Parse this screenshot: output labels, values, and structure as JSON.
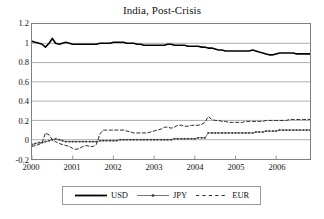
{
  "chart_data": {
    "type": "line",
    "title": "India, Post-Crisis",
    "xlabel": "",
    "ylabel": "",
    "ylim": [
      -0.2,
      1.2
    ],
    "xlim": [
      2000.0,
      2006.83
    ],
    "ytick_labels": [
      "1.2",
      "1",
      "0.8",
      "0.6",
      "0.4",
      "0.2",
      "0",
      "-0.2"
    ],
    "ytick_values": [
      1.2,
      1.0,
      0.8,
      0.6,
      0.4,
      0.2,
      0.0,
      -0.2
    ],
    "xtick_labels": [
      "2000",
      "2001",
      "2002",
      "2003",
      "2004",
      "2005",
      "2006"
    ],
    "xtick_values": [
      2000,
      2001,
      2002,
      2003,
      2004,
      2005,
      2006
    ],
    "grid": "horizontal",
    "legend_position": "below",
    "series": [
      {
        "name": "USD",
        "style": "solid-thick",
        "color": "#000000",
        "x": [
          2000.0,
          2000.08,
          2000.17,
          2000.25,
          2000.33,
          2000.42,
          2000.5,
          2000.58,
          2000.67,
          2000.75,
          2000.83,
          2000.92,
          2001.0,
          2001.08,
          2001.17,
          2001.25,
          2001.33,
          2001.42,
          2001.5,
          2001.58,
          2001.67,
          2001.75,
          2001.83,
          2001.92,
          2002.0,
          2002.08,
          2002.17,
          2002.25,
          2002.33,
          2002.42,
          2002.5,
          2002.58,
          2002.67,
          2002.75,
          2002.83,
          2002.92,
          2003.0,
          2003.08,
          2003.17,
          2003.25,
          2003.33,
          2003.42,
          2003.5,
          2003.58,
          2003.67,
          2003.75,
          2003.83,
          2003.92,
          2004.0,
          2004.08,
          2004.17,
          2004.25,
          2004.33,
          2004.42,
          2004.5,
          2004.58,
          2004.67,
          2004.75,
          2004.83,
          2004.92,
          2005.0,
          2005.08,
          2005.17,
          2005.25,
          2005.33,
          2005.42,
          2005.5,
          2005.58,
          2005.67,
          2005.75,
          2005.83,
          2005.92,
          2006.0,
          2006.08,
          2006.17,
          2006.25,
          2006.33,
          2006.42,
          2006.5,
          2006.58,
          2006.67,
          2006.75,
          2006.83
        ],
        "values": [
          1.02,
          1.01,
          1.0,
          0.99,
          0.96,
          1.0,
          1.05,
          1.0,
          0.99,
          1.0,
          1.01,
          1.0,
          0.99,
          0.99,
          0.99,
          0.99,
          0.99,
          0.99,
          0.99,
          0.99,
          1.0,
          1.0,
          1.0,
          1.0,
          1.01,
          1.01,
          1.01,
          1.01,
          1.0,
          1.0,
          1.0,
          0.99,
          0.99,
          0.98,
          0.98,
          0.98,
          0.98,
          0.98,
          0.98,
          0.98,
          0.99,
          0.99,
          0.98,
          0.98,
          0.98,
          0.98,
          0.97,
          0.97,
          0.97,
          0.97,
          0.96,
          0.96,
          0.95,
          0.95,
          0.94,
          0.93,
          0.93,
          0.92,
          0.92,
          0.92,
          0.92,
          0.92,
          0.92,
          0.92,
          0.92,
          0.93,
          0.92,
          0.91,
          0.9,
          0.89,
          0.88,
          0.88,
          0.89,
          0.9,
          0.9,
          0.9,
          0.9,
          0.9,
          0.89,
          0.89,
          0.89,
          0.89,
          0.89
        ]
      },
      {
        "name": "JPY",
        "style": "thin-with-markers",
        "color": "#3a3a3a",
        "x": [
          2000.0,
          2000.08,
          2000.17,
          2000.25,
          2000.33,
          2000.42,
          2000.5,
          2000.58,
          2000.67,
          2000.75,
          2000.83,
          2000.92,
          2001.0,
          2001.08,
          2001.17,
          2001.25,
          2001.33,
          2001.42,
          2001.5,
          2001.58,
          2001.67,
          2001.75,
          2001.83,
          2001.92,
          2002.0,
          2002.08,
          2002.17,
          2002.25,
          2002.33,
          2002.42,
          2002.5,
          2002.58,
          2002.67,
          2002.75,
          2002.83,
          2002.92,
          2003.0,
          2003.08,
          2003.17,
          2003.25,
          2003.33,
          2003.42,
          2003.5,
          2003.58,
          2003.67,
          2003.75,
          2003.83,
          2003.92,
          2004.0,
          2004.08,
          2004.17,
          2004.25,
          2004.33,
          2004.42,
          2004.5,
          2004.58,
          2004.67,
          2004.75,
          2004.83,
          2004.92,
          2005.0,
          2005.08,
          2005.17,
          2005.25,
          2005.33,
          2005.42,
          2005.5,
          2005.58,
          2005.67,
          2005.75,
          2005.83,
          2005.92,
          2006.0,
          2006.08,
          2006.17,
          2006.25,
          2006.33,
          2006.42,
          2006.5,
          2006.58,
          2006.67,
          2006.75,
          2006.83
        ],
        "values": [
          -0.05,
          -0.04,
          -0.03,
          -0.03,
          -0.02,
          -0.01,
          0.0,
          0.01,
          0.0,
          -0.01,
          -0.02,
          -0.02,
          -0.02,
          -0.02,
          -0.02,
          -0.02,
          -0.02,
          -0.02,
          -0.02,
          -0.02,
          -0.01,
          -0.01,
          -0.01,
          -0.01,
          -0.01,
          -0.01,
          0.0,
          0.0,
          0.0,
          0.0,
          0.0,
          0.0,
          0.0,
          0.0,
          0.0,
          0.0,
          0.0,
          0.0,
          0.0,
          0.0,
          0.0,
          0.0,
          0.01,
          0.01,
          0.01,
          0.01,
          0.01,
          0.01,
          0.01,
          0.02,
          0.02,
          0.02,
          0.07,
          0.07,
          0.07,
          0.07,
          0.07,
          0.07,
          0.07,
          0.07,
          0.07,
          0.07,
          0.07,
          0.07,
          0.07,
          0.07,
          0.08,
          0.08,
          0.08,
          0.09,
          0.09,
          0.09,
          0.09,
          0.1,
          0.1,
          0.1,
          0.1,
          0.1,
          0.1,
          0.1,
          0.1,
          0.1,
          0.1
        ]
      },
      {
        "name": "EUR",
        "style": "dashed",
        "color": "#2b2b2b",
        "x": [
          2000.0,
          2000.08,
          2000.17,
          2000.25,
          2000.33,
          2000.42,
          2000.5,
          2000.58,
          2000.67,
          2000.75,
          2000.83,
          2000.92,
          2001.0,
          2001.08,
          2001.17,
          2001.25,
          2001.33,
          2001.42,
          2001.5,
          2001.58,
          2001.67,
          2001.75,
          2001.83,
          2001.92,
          2002.0,
          2002.08,
          2002.17,
          2002.25,
          2002.33,
          2002.42,
          2002.5,
          2002.58,
          2002.67,
          2002.75,
          2002.83,
          2002.92,
          2003.0,
          2003.08,
          2003.17,
          2003.25,
          2003.33,
          2003.42,
          2003.5,
          2003.58,
          2003.67,
          2003.75,
          2003.83,
          2003.92,
          2004.0,
          2004.08,
          2004.17,
          2004.25,
          2004.33,
          2004.42,
          2004.5,
          2004.58,
          2004.67,
          2004.75,
          2004.83,
          2004.92,
          2005.0,
          2005.08,
          2005.17,
          2005.25,
          2005.33,
          2005.42,
          2005.5,
          2005.58,
          2005.67,
          2005.75,
          2005.83,
          2005.92,
          2006.0,
          2006.08,
          2006.17,
          2006.25,
          2006.33,
          2006.42,
          2006.5,
          2006.58,
          2006.67,
          2006.75,
          2006.83
        ],
        "values": [
          -0.07,
          -0.06,
          -0.05,
          -0.03,
          0.07,
          0.05,
          0.0,
          -0.02,
          -0.04,
          -0.05,
          -0.06,
          -0.07,
          -0.09,
          -0.1,
          -0.09,
          -0.07,
          -0.06,
          -0.07,
          -0.07,
          -0.05,
          0.06,
          0.1,
          0.1,
          0.1,
          0.1,
          0.1,
          0.1,
          0.1,
          0.09,
          0.08,
          0.07,
          0.07,
          0.07,
          0.07,
          0.07,
          0.08,
          0.09,
          0.1,
          0.11,
          0.13,
          0.13,
          0.12,
          0.13,
          0.15,
          0.15,
          0.14,
          0.14,
          0.15,
          0.15,
          0.15,
          0.16,
          0.18,
          0.24,
          0.21,
          0.2,
          0.2,
          0.19,
          0.19,
          0.18,
          0.18,
          0.18,
          0.18,
          0.18,
          0.19,
          0.19,
          0.19,
          0.19,
          0.19,
          0.19,
          0.2,
          0.2,
          0.2,
          0.2,
          0.2,
          0.2,
          0.2,
          0.21,
          0.21,
          0.21,
          0.21,
          0.21,
          0.21,
          0.21
        ]
      }
    ]
  },
  "legend": {
    "entries": [
      {
        "label": "USD",
        "key": "solid-thick-line-key"
      },
      {
        "label": "JPY",
        "key": "marker-line-key"
      },
      {
        "label": "EUR",
        "key": "dashed-line-key"
      }
    ]
  }
}
